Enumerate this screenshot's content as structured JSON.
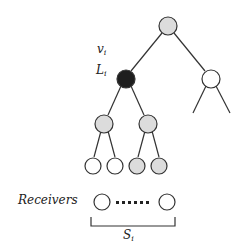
{
  "labels": {
    "v": "v",
    "v_sub": "i",
    "L": "L",
    "L_sub": "i",
    "receivers": "Receivers",
    "S": "S",
    "S_sub": "i"
  },
  "colors": {
    "gray": "#dcdcdc",
    "black": "#1e1e1e",
    "white": "#ffffff",
    "stroke": "#333333"
  }
}
